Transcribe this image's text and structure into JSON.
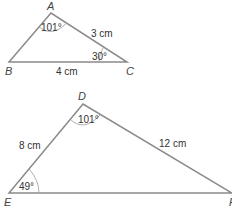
{
  "diagram": {
    "triangle1": {
      "vertices": {
        "A": {
          "label": "A",
          "x": 51,
          "y": 13
        },
        "B": {
          "label": "B",
          "x": 9,
          "y": 62
        },
        "C": {
          "label": "C",
          "x": 127,
          "y": 62
        }
      },
      "angle_A": "101°",
      "angle_C": "30°",
      "side_AC": "3 cm",
      "side_BC": "4 cm"
    },
    "triangle2": {
      "vertices": {
        "D": {
          "label": "D",
          "x": 83,
          "y": 104
        },
        "E": {
          "label": "E",
          "x": 9,
          "y": 193
        },
        "F": {
          "label": "F",
          "x": 232,
          "y": 193
        }
      },
      "angle_D": "101°",
      "angle_E": "49°",
      "side_DE": "8 cm",
      "side_DF": "12 cm"
    },
    "colors": {
      "line": "#8a8a8a",
      "text": "#333333",
      "background": "#ffffff"
    }
  }
}
